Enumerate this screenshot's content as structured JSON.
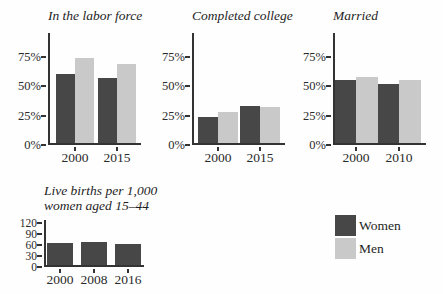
{
  "figure": {
    "background": "#fefefe",
    "colors": {
      "women": "#474747",
      "men": "#c9c9c9",
      "axis": "#333333",
      "text": "#2a2a2a"
    },
    "legend": {
      "items": [
        {
          "label": "Women",
          "series": "women"
        },
        {
          "label": "Men",
          "series": "men"
        }
      ]
    }
  },
  "chart_data": [
    {
      "type": "bar",
      "title": "In the labor force",
      "categories": [
        "2000",
        "2015"
      ],
      "series": [
        {
          "name": "Women",
          "values": [
            60,
            57
          ]
        },
        {
          "name": "Men",
          "values": [
            74,
            69
          ]
        }
      ],
      "xlabel": "",
      "ylabel": "",
      "ylim": [
        0,
        95
      ],
      "yticks": [
        0,
        25,
        50,
        75
      ],
      "ytick_labels": [
        "0%",
        "25%",
        "50%",
        "75%"
      ],
      "grid": false,
      "legend_position": "bottom-right-of-figure"
    },
    {
      "type": "bar",
      "title": "Completed college",
      "categories": [
        "2000",
        "2015"
      ],
      "series": [
        {
          "name": "Women",
          "values": [
            24,
            33
          ]
        },
        {
          "name": "Men",
          "values": [
            28,
            32
          ]
        }
      ],
      "xlabel": "",
      "ylabel": "",
      "ylim": [
        0,
        95
      ],
      "yticks": [
        0,
        25,
        50,
        75
      ],
      "ytick_labels": [
        "0%",
        "25%",
        "50%",
        "75%"
      ],
      "grid": false
    },
    {
      "type": "bar",
      "title": "Married",
      "categories": [
        "2000",
        "2010"
      ],
      "series": [
        {
          "name": "Women",
          "values": [
            55,
            52
          ]
        },
        {
          "name": "Men",
          "values": [
            58,
            55
          ]
        }
      ],
      "xlabel": "",
      "ylabel": "",
      "ylim": [
        0,
        95
      ],
      "yticks": [
        0,
        25,
        50,
        75
      ],
      "ytick_labels": [
        "0%",
        "25%",
        "50%",
        "75%"
      ],
      "grid": false
    },
    {
      "type": "bar",
      "title": "Live births per 1,000 women aged 15–44",
      "title_lines": [
        "Live births per 1,000",
        "women aged 15–44"
      ],
      "categories": [
        "2000",
        "2008",
        "2016"
      ],
      "series": [
        {
          "name": "Women",
          "values": [
            66,
            68,
            62
          ]
        }
      ],
      "xlabel": "",
      "ylabel": "",
      "ylim": [
        0,
        128
      ],
      "yticks": [
        0,
        30,
        60,
        90,
        120
      ],
      "ytick_labels": [
        "0",
        "30",
        "60",
        "90",
        "120"
      ],
      "grid": false
    }
  ]
}
